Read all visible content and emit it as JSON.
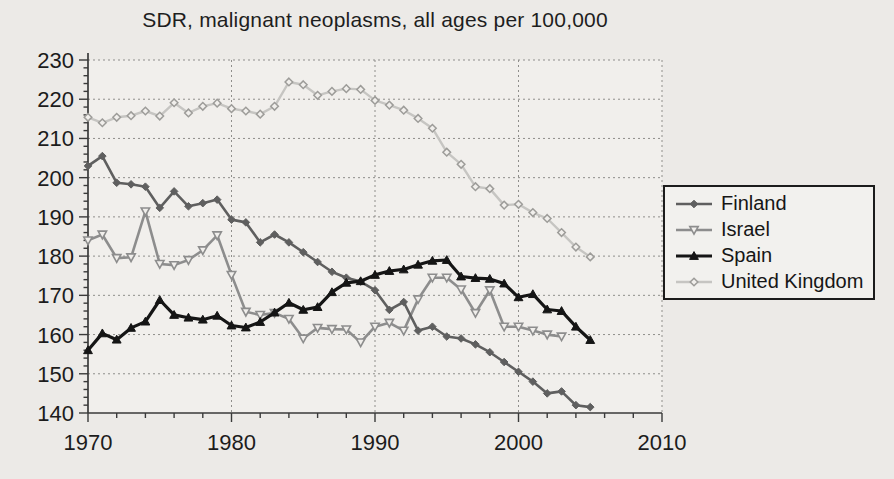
{
  "title": "SDR, malignant neoplasms, all ages per 100,000",
  "legend": {
    "items": [
      {
        "label": "Finland"
      },
      {
        "label": "Israel"
      },
      {
        "label": "Spain"
      },
      {
        "label": "United Kingdom"
      }
    ]
  },
  "chart_data": {
    "type": "line",
    "title": "SDR, malignant neoplasms, all ages per 100,000",
    "xlabel": "",
    "ylabel": "",
    "xlim": [
      1970,
      2010
    ],
    "ylim": [
      140,
      230
    ],
    "x_ticks": [
      1970,
      1980,
      1990,
      2000,
      2010
    ],
    "y_ticks": [
      140,
      150,
      160,
      170,
      180,
      190,
      200,
      210,
      220,
      230
    ],
    "x_minor_step": 2,
    "y_minor_step": 2,
    "grid": "dashed",
    "legend_position": "right",
    "x": [
      1970,
      1971,
      1972,
      1973,
      1974,
      1975,
      1976,
      1977,
      1978,
      1979,
      1980,
      1981,
      1982,
      1983,
      1984,
      1985,
      1986,
      1987,
      1988,
      1989,
      1990,
      1991,
      1992,
      1993,
      1994,
      1995,
      1996,
      1997,
      1998,
      1999,
      2000,
      2001,
      2002,
      2003,
      2004,
      2005
    ],
    "series": [
      {
        "name": "Finland",
        "marker": "diamond-filled",
        "color": "#5f5f5f",
        "line_width": 2.6,
        "values": [
          203,
          205.5,
          198.7,
          198.3,
          197.7,
          192.3,
          196.5,
          192.7,
          193.5,
          194.4,
          189.3,
          188.6,
          183.5,
          185.5,
          183.5,
          181,
          178.5,
          176,
          174.5,
          173.5,
          171.3,
          166.3,
          168.3,
          161,
          162,
          159.5,
          159,
          157.5,
          155.5,
          153,
          150.5,
          148,
          145,
          145.5,
          142,
          141.5
        ]
      },
      {
        "name": "Israel",
        "marker": "triangle-down-open",
        "color": "#8d8d8d",
        "line_width": 2.6,
        "values": [
          184,
          185.5,
          179.5,
          179.7,
          191.4,
          178,
          177.7,
          179,
          181.5,
          185.3,
          175.2,
          165.8,
          165,
          165.5,
          164,
          159,
          161.7,
          161.4,
          161.3,
          158,
          162,
          163,
          161,
          169,
          174.5,
          174.5,
          171.5,
          165.5,
          171.3,
          162,
          162,
          161,
          160,
          159.5,
          null,
          null
        ]
      },
      {
        "name": "Spain",
        "marker": "triangle-up-filled",
        "color": "#151515",
        "line_width": 3.2,
        "values": [
          156,
          160.3,
          158.7,
          161.7,
          163.3,
          168.8,
          165,
          164.3,
          163.8,
          164.8,
          162.3,
          161.8,
          163.2,
          165.6,
          168.1,
          166.3,
          167,
          170.8,
          173.2,
          173.6,
          175.2,
          176.2,
          176.6,
          177.8,
          178.8,
          179,
          174.8,
          174.4,
          174.2,
          173,
          169.5,
          170.3,
          166.4,
          166,
          162,
          158.6
        ]
      },
      {
        "name": "United Kingdom",
        "marker": "diamond-open",
        "color": "#c6c5c2",
        "marker_color": "#9d9c99",
        "line_width": 2.4,
        "values": [
          215.4,
          214,
          215.4,
          215.8,
          217,
          215.7,
          219.1,
          216.5,
          218.2,
          219,
          217.6,
          217,
          216.2,
          218.2,
          224.4,
          223.7,
          221,
          222,
          222.7,
          222.5,
          219.7,
          218.5,
          217.2,
          215.1,
          212.6,
          206.5,
          203.4,
          197.7,
          197.2,
          193,
          193.2,
          191.1,
          189.6,
          186,
          182.3,
          179.8
        ]
      }
    ],
    "colors": {
      "plot_bg": "#f1efec",
      "grid": "#8f8e8b",
      "axis": "#3a3a3a",
      "tick_label": "#1c1c1c"
    }
  }
}
